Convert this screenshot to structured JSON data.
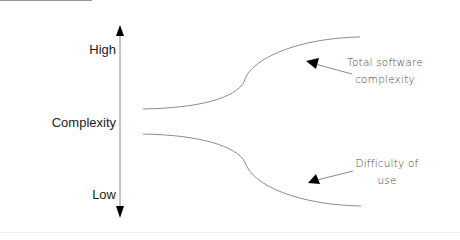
{
  "axis": {
    "label": "Complexity",
    "high_label": "High",
    "low_label": "Low"
  },
  "curves": [
    {
      "name": "Total software complexity",
      "direction": "rising"
    },
    {
      "name": "Difficulty of use",
      "direction": "falling"
    }
  ],
  "annotations": {
    "upper": {
      "line1": "Total software",
      "line2": "complexity"
    },
    "lower": {
      "line1": "Difficulty of",
      "line2": "use"
    }
  },
  "colors": {
    "axis": "#888888",
    "curve": "#8c8c8c",
    "arrowhead": "#000000",
    "text": "#222222"
  }
}
